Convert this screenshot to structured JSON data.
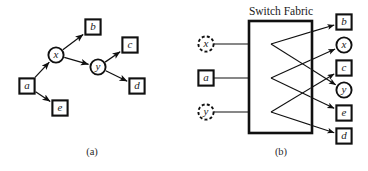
{
  "figure": {
    "panel_a": {
      "caption": "(a)",
      "nodes": [
        {
          "id": "a",
          "label": "a",
          "shape": "square",
          "style": "solid",
          "x": 27,
          "y": 86
        },
        {
          "id": "x",
          "label": "x",
          "shape": "circle",
          "style": "solid",
          "x": 56,
          "y": 55
        },
        {
          "id": "y",
          "label": "y",
          "shape": "circle",
          "style": "solid",
          "x": 98,
          "y": 67
        },
        {
          "id": "b",
          "label": "b",
          "shape": "square",
          "style": "solid",
          "x": 93,
          "y": 27
        },
        {
          "id": "c",
          "label": "c",
          "shape": "square",
          "style": "solid",
          "x": 130,
          "y": 45
        },
        {
          "id": "d",
          "label": "d",
          "shape": "square",
          "style": "solid",
          "x": 137,
          "y": 86
        },
        {
          "id": "e",
          "label": "e",
          "shape": "square",
          "style": "solid",
          "x": 60,
          "y": 108
        }
      ],
      "edges": [
        {
          "from": "a",
          "to": "x"
        },
        {
          "from": "a",
          "to": "e"
        },
        {
          "from": "x",
          "to": "b"
        },
        {
          "from": "x",
          "to": "y"
        },
        {
          "from": "y",
          "to": "c"
        },
        {
          "from": "y",
          "to": "d"
        }
      ]
    },
    "panel_b": {
      "caption": "(b)",
      "title": "Switch Fabric",
      "fabric_box": {
        "x": 249,
        "y": 21,
        "width": 63,
        "height": 112
      },
      "inputs": [
        {
          "id": "in-x",
          "label": "x",
          "shape": "circle",
          "style": "dashed",
          "x": 206,
          "y": 44
        },
        {
          "id": "in-a",
          "label": "a",
          "shape": "square",
          "style": "solid",
          "x": 206,
          "y": 78
        },
        {
          "id": "in-y",
          "label": "y",
          "shape": "circle",
          "style": "dashed",
          "x": 206,
          "y": 112
        }
      ],
      "outputs": [
        {
          "id": "out-b",
          "label": "b",
          "shape": "square",
          "style": "solid",
          "x": 344,
          "y": 22
        },
        {
          "id": "out-x",
          "label": "x",
          "shape": "circle",
          "style": "solid",
          "x": 344,
          "y": 45
        },
        {
          "id": "out-c",
          "label": "c",
          "shape": "square",
          "style": "solid",
          "x": 344,
          "y": 68
        },
        {
          "id": "out-y",
          "label": "y",
          "shape": "circle",
          "style": "solid",
          "x": 344,
          "y": 90
        },
        {
          "id": "out-e",
          "label": "e",
          "shape": "square",
          "style": "solid",
          "x": 344,
          "y": 113
        },
        {
          "id": "out-d",
          "label": "d",
          "shape": "square",
          "style": "solid",
          "x": 344,
          "y": 136
        }
      ],
      "connections": [
        {
          "from": "in-x",
          "to": "out-b"
        },
        {
          "from": "in-x",
          "to": "out-y"
        },
        {
          "from": "in-a",
          "to": "out-x"
        },
        {
          "from": "in-a",
          "to": "out-e"
        },
        {
          "from": "in-y",
          "to": "out-c"
        },
        {
          "from": "in-y",
          "to": "out-d"
        }
      ]
    }
  },
  "colors": {
    "ink": "#101010",
    "paper": "#ffffff"
  }
}
